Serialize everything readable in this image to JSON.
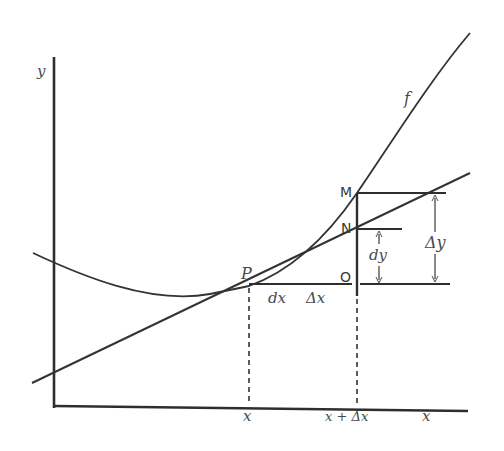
{
  "diagram": {
    "colors": {
      "ink": "#2e2e2e",
      "light_ink": "#555555",
      "background": "#ffffff"
    },
    "axes": {
      "y_label": "y",
      "x_label": "x"
    },
    "curve": {
      "label": "f"
    },
    "points": {
      "P": "P",
      "M": "M",
      "N": "N",
      "O": "O"
    },
    "tick_labels": {
      "x": "x",
      "x_plus_dx": "x + Δx"
    },
    "segment_labels": {
      "dx": "dx",
      "delta_x": "Δx",
      "dy": "dy",
      "delta_y": "Δy"
    }
  }
}
